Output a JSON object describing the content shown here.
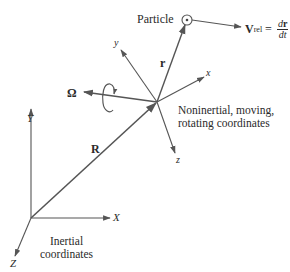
{
  "diagram": {
    "type": "rotating-reference-frame-vector-diagram",
    "colors": {
      "line": "#555555",
      "text": "#2a2a2a",
      "background": "#ffffff"
    },
    "particle": {
      "label": "Particle"
    },
    "velocity": {
      "symbol": "V",
      "subscript": "rel",
      "equals": "=",
      "numerator": "d",
      "numerator_bold": "r",
      "denominator": "dt"
    },
    "vectors": {
      "position_relative": "r",
      "position_origin": "R",
      "angular_velocity": "Ω"
    },
    "rotating_axes": {
      "x": "x",
      "y": "y",
      "z": "z"
    },
    "inertial_axes": {
      "X": "X",
      "Y": "Y",
      "Z": "Z"
    },
    "captions": {
      "rotating_line1": "Noninertial, moving,",
      "rotating_line2": "rotating coordinates",
      "inertial_line1": "Inertial",
      "inertial_line2": "coordinates"
    }
  }
}
